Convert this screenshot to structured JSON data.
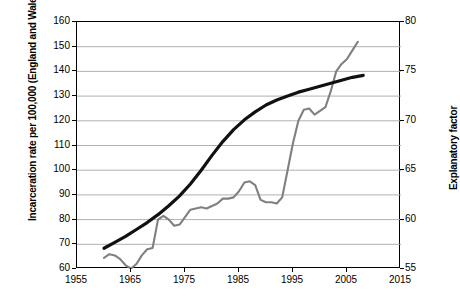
{
  "chart_data": {
    "type": "line",
    "title": "",
    "xlabel": "",
    "ylabel": "Incarceration rate per 100,000 (England and Wales)",
    "y2label": "Explanatory factor",
    "xlim": [
      1955,
      2015
    ],
    "ylim": [
      60,
      160
    ],
    "y2lim": [
      55,
      80
    ],
    "xticks": [
      "1955",
      "1965",
      "1975",
      "1985",
      "1995",
      "2005",
      "2015"
    ],
    "yticks": [
      "60",
      "70",
      "80",
      "90",
      "100",
      "110",
      "120",
      "130",
      "140",
      "150",
      "160"
    ],
    "y2ticks": [
      "55",
      "60",
      "65",
      "70",
      "75",
      "80"
    ],
    "grid": true,
    "legend_position": "none",
    "series": [
      {
        "name": "Incarceration rate per 100,000 (England and Wales)",
        "axis": "left",
        "color": "#808080",
        "width": 2.1,
        "x": [
          1960,
          1961,
          1962,
          1963,
          1964,
          1965,
          1966,
          1967,
          1968,
          1969,
          1970,
          1971,
          1972,
          1973,
          1974,
          1975,
          1976,
          1977,
          1978,
          1979,
          1980,
          1981,
          1982,
          1983,
          1984,
          1985,
          1986,
          1987,
          1988,
          1989,
          1990,
          1991,
          1992,
          1993,
          1994,
          1995,
          1996,
          1997,
          1998,
          1999,
          2000,
          2001,
          2002,
          2003,
          2004,
          2005,
          2006,
          2007
        ],
        "y": [
          64.5,
          66.0,
          65.5,
          64.0,
          61.5,
          60.2,
          62.0,
          65.5,
          68.0,
          68.5,
          80.0,
          81.5,
          80.0,
          77.5,
          78.0,
          81.0,
          84.0,
          84.5,
          85.0,
          84.5,
          85.5,
          86.5,
          88.5,
          88.5,
          89.0,
          91.5,
          95.0,
          95.5,
          94.0,
          88.0,
          87.0,
          87.0,
          86.5,
          89.0,
          100.0,
          111.0,
          120.0,
          124.5,
          125.0,
          122.5,
          124.0,
          125.5,
          132.0,
          140.0,
          143.0,
          145.0,
          148.5,
          152.0
        ]
      },
      {
        "name": "Explanatory factor",
        "axis": "right",
        "color": "#111111",
        "width": 3.2,
        "x": [
          1960,
          1962,
          1964,
          1966,
          1968,
          1970,
          1972,
          1974,
          1976,
          1978,
          1980,
          1982,
          1984,
          1986,
          1988,
          1990,
          1992,
          1994,
          1996,
          1998,
          2000,
          2002,
          2004,
          2006,
          2008
        ],
        "y": [
          57.1,
          57.7,
          58.3,
          59.0,
          59.7,
          60.5,
          61.4,
          62.4,
          63.6,
          65.0,
          66.5,
          67.9,
          69.1,
          70.1,
          70.9,
          71.6,
          72.1,
          72.5,
          72.9,
          73.2,
          73.5,
          73.8,
          74.1,
          74.4,
          74.6
        ]
      }
    ]
  },
  "axes": {
    "left_title": "Incarceration rate per 100,000 (England and Wales)",
    "right_title": "Explanatory factor"
  }
}
